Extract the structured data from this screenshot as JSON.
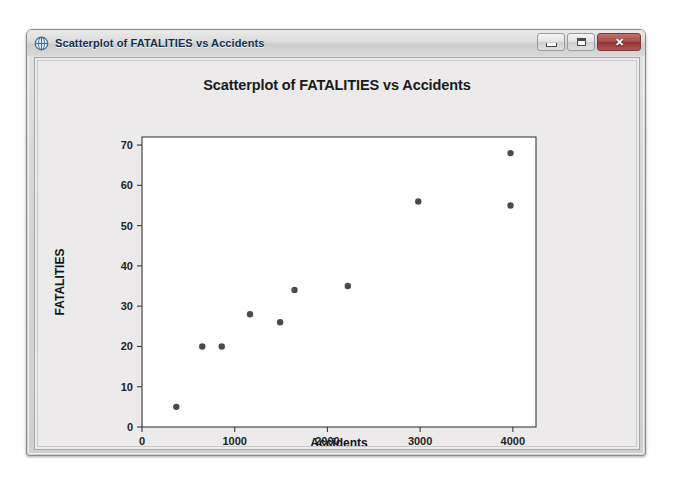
{
  "window": {
    "title": "Scatterplot of FATALITIES vs Accidents",
    "icon": "minitab-globe-icon",
    "controls": {
      "minimize_label": "–",
      "maximize_label": "□",
      "close_label": "✕"
    }
  },
  "colors": {
    "point": "#4a4a4a",
    "axis": "#3a3a3a",
    "title_text": "#12304e",
    "plot_background": "#ffffff",
    "chart_background": "#eceaea",
    "close_button": "#a94a48"
  },
  "chart_data": {
    "type": "scatter",
    "title": "Scatterplot of FATALITIES vs Accidents",
    "xlabel": "Accidents",
    "ylabel": "FATALITIES",
    "xlim": [
      0,
      4250
    ],
    "ylim": [
      0,
      72
    ],
    "xticks": [
      0,
      1000,
      2000,
      3000,
      4000
    ],
    "xtick_labels": [
      "0",
      "1000",
      "2000",
      "3000",
      "4000"
    ],
    "yticks": [
      0,
      10,
      20,
      30,
      40,
      50,
      60,
      70
    ],
    "ytick_labels": [
      "0",
      "10",
      "20",
      "30",
      "40",
      "50",
      "60",
      "70"
    ],
    "grid": false,
    "legend": null,
    "series": [
      {
        "name": "FATALITIES vs Accidents",
        "marker": "filled-circle",
        "color": "#4a4a4a",
        "points": [
          {
            "x": 370,
            "y": 5
          },
          {
            "x": 650,
            "y": 20
          },
          {
            "x": 860,
            "y": 20
          },
          {
            "x": 1165,
            "y": 28
          },
          {
            "x": 1490,
            "y": 26
          },
          {
            "x": 1645,
            "y": 34
          },
          {
            "x": 2220,
            "y": 35
          },
          {
            "x": 2980,
            "y": 56
          },
          {
            "x": 3975,
            "y": 68
          },
          {
            "x": 3975,
            "y": 55
          }
        ]
      }
    ]
  }
}
